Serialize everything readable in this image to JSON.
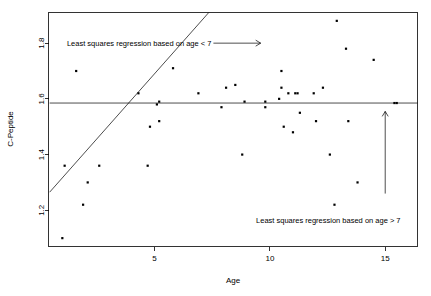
{
  "chart_data": {
    "type": "scatter",
    "title": "",
    "xlabel": "Age",
    "ylabel": "C-Peptide",
    "xlim": [
      0.4,
      16.4
    ],
    "ylim": [
      1.07,
      1.91
    ],
    "grid": false,
    "legend": "none",
    "xticks": [
      5,
      10,
      15
    ],
    "xtick_labels": [
      "5",
      "10",
      "15"
    ],
    "yticks": [
      1.2,
      1.4,
      1.6,
      1.8
    ],
    "ytick_labels": [
      "1.2",
      "1.4",
      "1.6",
      "1.8"
    ],
    "points": [
      {
        "x": 1.0,
        "y": 1.1
      },
      {
        "x": 1.1,
        "y": 1.36
      },
      {
        "x": 1.6,
        "y": 1.7
      },
      {
        "x": 1.9,
        "y": 1.22
      },
      {
        "x": 2.1,
        "y": 1.3
      },
      {
        "x": 2.6,
        "y": 1.36
      },
      {
        "x": 4.3,
        "y": 1.62
      },
      {
        "x": 4.7,
        "y": 1.36
      },
      {
        "x": 4.8,
        "y": 1.5
      },
      {
        "x": 5.1,
        "y": 1.58
      },
      {
        "x": 5.2,
        "y": 1.59
      },
      {
        "x": 5.2,
        "y": 1.52
      },
      {
        "x": 5.8,
        "y": 1.71
      },
      {
        "x": 6.9,
        "y": 1.62
      },
      {
        "x": 7.9,
        "y": 1.57
      },
      {
        "x": 8.1,
        "y": 1.64
      },
      {
        "x": 8.5,
        "y": 1.65
      },
      {
        "x": 8.8,
        "y": 1.4
      },
      {
        "x": 8.9,
        "y": 1.59
      },
      {
        "x": 9.8,
        "y": 1.57
      },
      {
        "x": 9.8,
        "y": 1.59
      },
      {
        "x": 10.4,
        "y": 1.6
      },
      {
        "x": 10.5,
        "y": 1.7
      },
      {
        "x": 10.5,
        "y": 1.64
      },
      {
        "x": 10.6,
        "y": 1.5
      },
      {
        "x": 10.8,
        "y": 1.62
      },
      {
        "x": 11.0,
        "y": 1.48
      },
      {
        "x": 11.1,
        "y": 1.62
      },
      {
        "x": 11.2,
        "y": 1.62
      },
      {
        "x": 11.3,
        "y": 1.55
      },
      {
        "x": 11.9,
        "y": 1.62
      },
      {
        "x": 12.0,
        "y": 1.52
      },
      {
        "x": 12.3,
        "y": 1.64
      },
      {
        "x": 12.6,
        "y": 1.4
      },
      {
        "x": 12.8,
        "y": 1.22
      },
      {
        "x": 12.9,
        "y": 1.88
      },
      {
        "x": 13.3,
        "y": 1.78
      },
      {
        "x": 13.4,
        "y": 1.52
      },
      {
        "x": 13.8,
        "y": 1.3
      },
      {
        "x": 14.5,
        "y": 1.74
      },
      {
        "x": 15.4,
        "y": 1.585
      },
      {
        "x": 15.5,
        "y": 1.585
      }
    ],
    "lines": [
      {
        "name": "least-squares-regression-age-lt-7",
        "x0": 0.45,
        "y0": 1.265,
        "x1": 7.35,
        "y1": 1.91
      },
      {
        "name": "least-squares-regression-age-gt-7",
        "x0": 0.45,
        "y0": 1.585,
        "x1": 16.4,
        "y1": 1.585
      }
    ],
    "annotations": [
      {
        "name": "annotation-age-lt-7",
        "text": "Least squares regression based on age < 7",
        "x": 1.2,
        "y": 1.8,
        "arrow": {
          "type": "horizontal",
          "x0": 7.55,
          "x1": 9.6,
          "y": 1.8
        }
      },
      {
        "name": "annotation-age-gt-7",
        "text": "Least squares regression based on age > 7",
        "x": 9.4,
        "y": 1.165,
        "arrow": {
          "type": "vertical",
          "x": 15.0,
          "y0": 1.26,
          "y1": 1.555
        }
      }
    ]
  }
}
